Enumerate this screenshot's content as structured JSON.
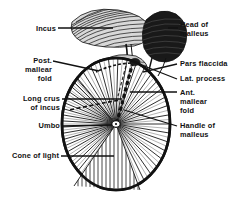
{
  "figure": {
    "background_color": "#ffffff",
    "ink_color": "#111111",
    "width": 232,
    "height": 197
  },
  "labels": {
    "incus": "Incus",
    "post_mallear_fold": "Post.\nmallear\nfold",
    "long_crus_of_incus": "Long crus\nof incus",
    "umbo": "Umbo",
    "cone_of_light": "Cone of light",
    "head_of_malleus": "Head of\nmalleus",
    "pars_flaccida": "Pars flaccida",
    "lat_process": "Lat. process",
    "ant_mallear_fold": "Ant.\nmallear\nfold",
    "handle_of_malleus": "Handle of\nmalleus"
  },
  "label_list": [
    {
      "id": "incus",
      "side": "left",
      "text": "Incus"
    },
    {
      "id": "post-mallear-fold",
      "side": "left",
      "text": "Post. mallear fold"
    },
    {
      "id": "long-crus-of-incus",
      "side": "left",
      "text": "Long crus of incus"
    },
    {
      "id": "umbo",
      "side": "left",
      "text": "Umbo"
    },
    {
      "id": "cone-of-light",
      "side": "left",
      "text": "Cone of light"
    },
    {
      "id": "head-of-malleus",
      "side": "right",
      "text": "Head of malleus"
    },
    {
      "id": "pars-flaccida",
      "side": "right",
      "text": "Pars flaccida"
    },
    {
      "id": "lat-process",
      "side": "right",
      "text": "Lat. process"
    },
    {
      "id": "ant-mallear-fold",
      "side": "right",
      "text": "Ant. mallear fold"
    },
    {
      "id": "handle-of-malleus",
      "side": "right",
      "text": "Handle of malleus"
    }
  ]
}
